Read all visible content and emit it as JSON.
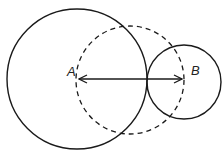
{
  "diagram": {
    "labels": {
      "a": "A",
      "b": "B"
    },
    "colors": {
      "stroke": "#1a1a1a",
      "background": "#ffffff"
    },
    "circles": [
      {
        "id": "large-circle",
        "cx": 77,
        "cy": 79,
        "r": 70,
        "style": "solid"
      },
      {
        "id": "dashed-circle",
        "cx": 130,
        "cy": 80,
        "r": 54,
        "style": "dashed"
      },
      {
        "id": "small-circle",
        "cx": 184,
        "cy": 82,
        "r": 37,
        "style": "solid"
      }
    ],
    "arrow": {
      "x1": 79,
      "y1": 79,
      "x2": 182,
      "y2": 79,
      "style": "double-headed"
    }
  }
}
